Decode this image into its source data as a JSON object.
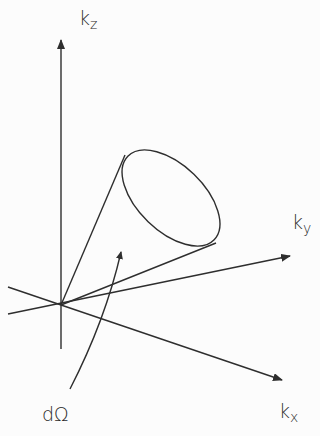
{
  "diagram": {
    "axes": {
      "kz": {
        "base": "k",
        "sub": "z"
      },
      "ky": {
        "base": "k",
        "sub": "y"
      },
      "kx": {
        "base": "k",
        "sub": "x"
      }
    },
    "solid_angle_label": "dΩ",
    "colors": {
      "stroke": "#2e2e2e",
      "background": "#fcfcfc"
    }
  }
}
